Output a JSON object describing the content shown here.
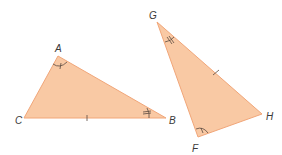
{
  "diagram": {
    "colors": {
      "fill": "#f9c9a4",
      "stroke": "#f1a679",
      "mark": "#5a4a40",
      "label": "#3a3a3a"
    },
    "triangles": [
      {
        "name": "ABC",
        "vertices": {
          "A": {
            "label": "A",
            "x": 58,
            "y": 56
          },
          "B": {
            "label": "B",
            "x": 166,
            "y": 118
          },
          "C": {
            "label": "C",
            "x": 24,
            "y": 118
          }
        },
        "marks": {
          "angle_A": "single arc, single tick",
          "angle_B": "single arc, double tick",
          "side_CB": "single tick"
        }
      },
      {
        "name": "GFH",
        "vertices": {
          "G": {
            "label": "G",
            "x": 157,
            "y": 22
          },
          "F": {
            "label": "F",
            "x": 198,
            "y": 137
          },
          "H": {
            "label": "H",
            "x": 262,
            "y": 114
          }
        },
        "marks": {
          "angle_G": "single arc, double tick",
          "angle_F": "single arc, single tick",
          "side_GH": "single tick"
        }
      }
    ],
    "labels": {
      "A": "A",
      "B": "B",
      "C": "C",
      "G": "G",
      "F": "F",
      "H": "H"
    }
  }
}
